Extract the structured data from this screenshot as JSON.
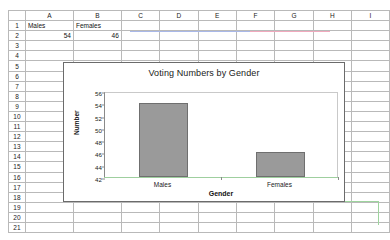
{
  "spreadsheet": {
    "column_headers": [
      "A",
      "B",
      "C",
      "D",
      "E",
      "F",
      "G",
      "H",
      "I"
    ],
    "row_headers": [
      "1",
      "2",
      "3",
      "4",
      "5",
      "6",
      "7",
      "8",
      "9",
      "10",
      "11",
      "12",
      "13",
      "14",
      "15",
      "16",
      "17",
      "18",
      "19",
      "20",
      "21"
    ],
    "cells": {
      "A1": "Males",
      "B1": "Females",
      "A2": "54",
      "B2": "46"
    }
  },
  "chart_data": {
    "type": "bar",
    "title": "Voting Numbers by Gender",
    "categories": [
      "Males",
      "Females"
    ],
    "values": [
      54,
      46
    ],
    "xlabel": "Gender",
    "ylabel": "Number",
    "ylim": [
      42,
      56
    ],
    "yticks": [
      42,
      44,
      46,
      48,
      50,
      52,
      54,
      56
    ],
    "grid": false,
    "legend": "none",
    "series_color": "#9a9a9a"
  }
}
